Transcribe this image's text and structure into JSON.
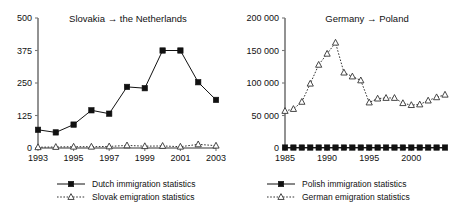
{
  "figure": {
    "background": "#ffffff",
    "text_color": "#111111",
    "axis_color": "#777777"
  },
  "chart_data": [
    {
      "id": "slovakia-netherlands",
      "type": "line",
      "title": "Slovakia → the Netherlands",
      "xlabel": "",
      "ylabel": "",
      "x": [
        1993,
        1994,
        1995,
        1996,
        1997,
        1998,
        1999,
        2000,
        2001,
        2002,
        2003
      ],
      "xlim": [
        1993,
        2003
      ],
      "ylim": [
        0,
        500
      ],
      "xticks": [
        1993,
        1995,
        1997,
        1999,
        2001,
        2003
      ],
      "xticklabels": [
        "1993",
        "1995",
        "1997",
        "1999",
        "2001",
        "2003"
      ],
      "yticks": [
        0,
        125,
        250,
        375,
        500
      ],
      "yticklabels": [
        "0",
        "125",
        "250",
        "375",
        "500"
      ],
      "grid": false,
      "legend_position": "below",
      "series": [
        {
          "name": "Dutch immigration statistics",
          "marker": "filled-square",
          "line": "solid",
          "color": "#111111",
          "values": [
            70,
            60,
            90,
            145,
            132,
            235,
            230,
            375,
            375,
            253,
            185
          ]
        },
        {
          "name": "Slovak emigration statistics",
          "marker": "open-triangle",
          "line": "dotted",
          "color": "#333333",
          "values": [
            3,
            4,
            5,
            5,
            6,
            10,
            7,
            8,
            5,
            14,
            9
          ]
        }
      ]
    },
    {
      "id": "germany-poland",
      "type": "line",
      "title": "Germany → Poland",
      "xlabel": "",
      "ylabel": "",
      "x": [
        1985,
        1986,
        1987,
        1988,
        1989,
        1990,
        1991,
        1992,
        1993,
        1994,
        1995,
        1996,
        1997,
        1998,
        1999,
        2000,
        2001,
        2002,
        2003,
        2004
      ],
      "xlim": [
        1985,
        2004
      ],
      "ylim": [
        0,
        200000
      ],
      "xticks": [
        1985,
        1990,
        1995,
        2000
      ],
      "xticklabels": [
        "1985",
        "1990",
        "1995",
        "2000"
      ],
      "yticks": [
        0,
        50000,
        100000,
        150000,
        200000
      ],
      "yticklabels": [
        "0",
        "50 000",
        "100 000",
        "150 000",
        "200 000"
      ],
      "grid": false,
      "legend_position": "below",
      "series": [
        {
          "name": "Polish immigration statistics",
          "marker": "filled-square",
          "line": "solid",
          "color": "#111111",
          "values": [
            700,
            700,
            700,
            700,
            700,
            700,
            700,
            700,
            700,
            700,
            700,
            700,
            700,
            700,
            700,
            700,
            700,
            700,
            700,
            700
          ]
        },
        {
          "name": "German emigration statistics",
          "marker": "open-triangle",
          "line": "dotted",
          "color": "#333333",
          "values": [
            57000,
            60000,
            71000,
            99000,
            128000,
            145000,
            162000,
            116000,
            110000,
            104000,
            70000,
            76000,
            77000,
            77000,
            69000,
            66000,
            67000,
            73000,
            78000,
            82000
          ]
        }
      ]
    }
  ]
}
